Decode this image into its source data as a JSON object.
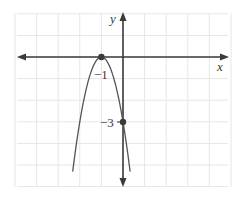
{
  "chart_data": {
    "type": "line",
    "title": "",
    "xlabel": "x",
    "ylabel": "y",
    "function": "y = -3(x + 1)^2",
    "grid": true,
    "xlim": [
      -5,
      5
    ],
    "ylim": [
      -6,
      2
    ],
    "series": [
      {
        "name": "parabola",
        "x": [
          -2.33,
          -2,
          -1.5,
          -1,
          -0.5,
          0,
          0.33
        ],
        "y": [
          -5.3,
          -3,
          -0.75,
          0,
          -0.75,
          -3,
          -5.3
        ]
      }
    ],
    "points": [
      {
        "x": -1,
        "y": 0,
        "label": "−1"
      },
      {
        "x": 0,
        "y": -3,
        "label": "−3"
      }
    ],
    "annotations": [
      "−1",
      "−3"
    ]
  },
  "labels": {
    "x_axis": "x",
    "y_axis": "y",
    "vertex": "−1",
    "intercept": "−3"
  },
  "colors": {
    "grid": "#e6e6e6",
    "axis": "#3a3a3a",
    "curve": "#555555",
    "point": "#3a3a3a"
  }
}
